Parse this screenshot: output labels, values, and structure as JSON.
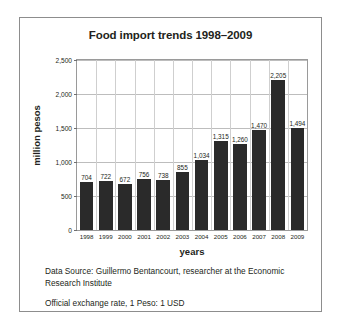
{
  "chart_data": {
    "type": "bar",
    "title": "Food import trends 1998–2009",
    "xlabel": "years",
    "ylabel": "million pesos",
    "categories": [
      "1998",
      "1999",
      "2000",
      "2001",
      "2002",
      "2003",
      "2004",
      "2005",
      "2006",
      "2007",
      "2008",
      "2009"
    ],
    "values": [
      704,
      722,
      672,
      756,
      738,
      855,
      1034,
      1315,
      1260,
      1470,
      2205,
      1494
    ],
    "value_labels": [
      "704",
      "722",
      "672",
      "756",
      "738",
      "855",
      "1,034",
      "1,315",
      "1,260",
      "1,470",
      "2,205",
      "1,494"
    ],
    "ylim": [
      0,
      2500
    ],
    "yticks": [
      0,
      500,
      1000,
      1500,
      2000,
      2500
    ],
    "ytick_labels": [
      "0",
      "500",
      "1,000",
      "1,500",
      "2,000",
      "2,500"
    ],
    "grid": "horizontal-and-vertical",
    "legend": "none",
    "bar_color": "#2a2a2a",
    "gridline_color": "#bdbdbd",
    "axis_color": "#9a9a9a",
    "text_color": "#231f20",
    "background_color": "#ffffff"
  },
  "footnotes": [
    "Data Source: Guillermo Bentancourt, researcher at the Economic Research Institute",
    "Official exchange rate, 1 Peso: 1 USD"
  ]
}
